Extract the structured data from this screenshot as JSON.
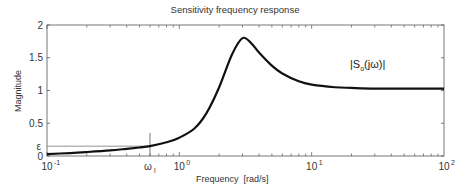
{
  "chart_data": {
    "type": "line",
    "title": "Sensitivity frequency response",
    "xlabel": "Frequency  [rad/s]",
    "ylabel": "Magnitude",
    "xscale": "log",
    "xlim": [
      0.1,
      100
    ],
    "ylim": [
      0,
      2
    ],
    "x_ticks": [
      "10^-1",
      "10^0",
      "10^1",
      "10^2"
    ],
    "y_ticks": [
      "0",
      "0.5",
      "1",
      "1.5",
      "2"
    ],
    "grid": false,
    "series": [
      {
        "name": "|S_o(jω)|",
        "x": [
          0.1,
          0.15,
          0.2,
          0.3,
          0.4,
          0.5,
          0.6,
          0.8,
          1.0,
          1.3,
          1.6,
          2.0,
          2.5,
          3.0,
          3.5,
          4.0,
          5.0,
          6.0,
          8.0,
          10,
          15,
          20,
          30,
          50,
          100
        ],
        "values": [
          0.03,
          0.045,
          0.06,
          0.085,
          0.11,
          0.13,
          0.15,
          0.21,
          0.28,
          0.42,
          0.65,
          1.05,
          1.55,
          1.8,
          1.72,
          1.58,
          1.38,
          1.26,
          1.14,
          1.09,
          1.05,
          1.04,
          1.03,
          1.03,
          1.03
        ]
      }
    ],
    "annotations": [
      {
        "type": "hline",
        "label": "ε",
        "y": 0.15,
        "x_end": 0.6
      },
      {
        "type": "vline",
        "label": "ω_l",
        "x": 0.6
      },
      {
        "type": "text",
        "label": "|S_o(jω)|",
        "x": 20,
        "y": 1.15
      }
    ]
  },
  "labels": {
    "title": "Sensitivity frequency response",
    "xlabel": "Frequency  [rad/s]",
    "ylabel": "Magnitude",
    "epsilon": "ε",
    "omega_l_main": "ω",
    "omega_l_sub": "l",
    "curve_main": "|S",
    "curve_sub": "o",
    "curve_tail": "(jω)|"
  }
}
